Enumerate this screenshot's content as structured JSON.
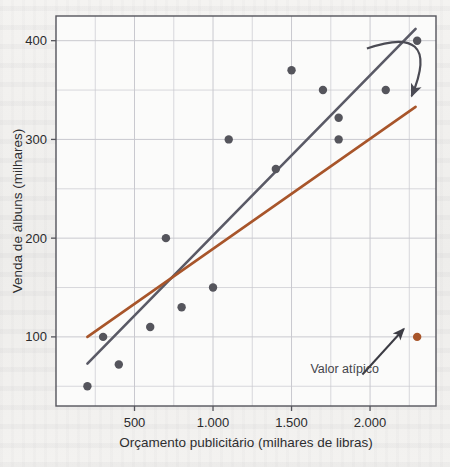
{
  "figure": {
    "background_color": "#f2f1ef",
    "plot_background_color": "#fbfbfa",
    "frame_color": "#55555c",
    "grid_color": "#c9c9cf"
  },
  "chart_data": {
    "type": "scatter",
    "title": "",
    "xlabel": "Orçamento publicitário (milhares de libras)",
    "ylabel": "Venda de álbuns (milhares)",
    "xlim": [
      0,
      2420
    ],
    "ylim": [
      30,
      425
    ],
    "grid": true,
    "legend_position": "none",
    "xticks": [
      500,
      1000,
      1500,
      2000
    ],
    "xtick_labels": [
      "500",
      "1.000",
      "1.500",
      "2.000"
    ],
    "yticks": [
      100,
      200,
      300,
      400
    ],
    "ytick_labels": [
      "100",
      "200",
      "300",
      "400"
    ],
    "point_color": "#55555c",
    "outlier_color": "#a8552a",
    "series": [
      {
        "name": "Venda de álbuns",
        "marker_color": "#55555c",
        "points": [
          {
            "x": 200,
            "y": 50
          },
          {
            "x": 300,
            "y": 100
          },
          {
            "x": 400,
            "y": 72
          },
          {
            "x": 600,
            "y": 110
          },
          {
            "x": 700,
            "y": 200
          },
          {
            "x": 800,
            "y": 130
          },
          {
            "x": 1000,
            "y": 150
          },
          {
            "x": 1100,
            "y": 300
          },
          {
            "x": 1400,
            "y": 270
          },
          {
            "x": 1500,
            "y": 370
          },
          {
            "x": 1700,
            "y": 350
          },
          {
            "x": 1800,
            "y": 300
          },
          {
            "x": 1800,
            "y": 322
          },
          {
            "x": 2100,
            "y": 350
          },
          {
            "x": 2300,
            "y": 400
          }
        ]
      },
      {
        "name": "Valor atípico",
        "marker_color": "#a8552a",
        "points": [
          {
            "x": 2300,
            "y": 100
          }
        ]
      }
    ],
    "lines": [
      {
        "name": "linha-de-regressao-sem-atipico",
        "color": "#5a5a66",
        "width": 2.6,
        "x0": 200,
        "y0": 73,
        "x1": 2290,
        "y1": 412
      },
      {
        "name": "linha-de-regressao-com-atipico",
        "color": "#a8552a",
        "width": 2.6,
        "x0": 200,
        "y0": 100,
        "x1": 2290,
        "y1": 333
      }
    ],
    "annotations": [
      {
        "name": "valor-atipico-label",
        "text": "Valor atípico",
        "x": 1620,
        "y": 68,
        "arrow_to_x": 2215,
        "arrow_to_y": 108
      },
      {
        "name": "curved-arrow-to-orange-line",
        "text": "",
        "from_x": 1980,
        "from_y": 392,
        "to_x": 2265,
        "to_y": 344
      }
    ]
  }
}
